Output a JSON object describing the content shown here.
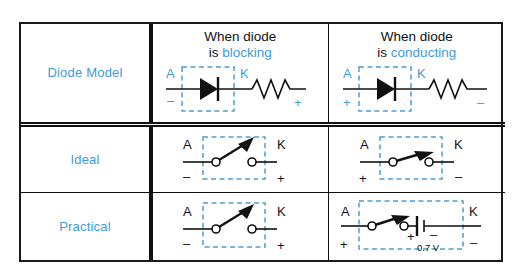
{
  "table": {
    "columns": [
      {
        "id": "model",
        "header": ""
      },
      {
        "id": "blocking",
        "header_line1": "When diode",
        "header_line2_prefix": "is ",
        "header_line2_highlight": "blocking"
      },
      {
        "id": "conducting",
        "header_line1": "When diode",
        "header_line2_prefix": "is ",
        "header_line2_highlight": "conducting"
      }
    ],
    "rows": [
      {
        "label": "Diode Model",
        "blocking": {
          "anode_label": "A",
          "anode_polarity": "–",
          "cathode_label": "K",
          "cathode_polarity": "+",
          "symbol": "diode",
          "extra_component": "resistor",
          "note": ""
        },
        "conducting": {
          "anode_label": "A",
          "anode_polarity": "+",
          "cathode_label": "K",
          "cathode_polarity": "–",
          "symbol": "diode",
          "extra_component": "resistor",
          "note": ""
        }
      },
      {
        "label": "Ideal",
        "blocking": {
          "anode_label": "A",
          "anode_polarity": "–",
          "cathode_label": "K",
          "cathode_polarity": "+",
          "symbol": "switch-open",
          "extra_component": "",
          "note": ""
        },
        "conducting": {
          "anode_label": "A",
          "anode_polarity": "+",
          "cathode_label": "K",
          "cathode_polarity": "–",
          "symbol": "switch-closed",
          "extra_component": "",
          "note": ""
        }
      },
      {
        "label": "Practical",
        "blocking": {
          "anode_label": "A",
          "anode_polarity": "–",
          "cathode_label": "K",
          "cathode_polarity": "+",
          "symbol": "switch-open",
          "extra_component": "",
          "note": ""
        },
        "conducting": {
          "anode_label": "A",
          "anode_polarity": "+",
          "cathode_label": "K",
          "cathode_polarity": "–",
          "symbol": "switch-closed",
          "extra_component": "battery",
          "battery_plus": "+",
          "battery_minus": "–",
          "note": "0.7 V"
        }
      }
    ]
  },
  "colors": {
    "accent_blue": "#3f9bd8",
    "dashed_box_blue": "#4a9fd8",
    "line_black": "#111111",
    "background": "#ffffff"
  }
}
